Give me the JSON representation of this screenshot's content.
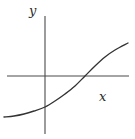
{
  "figure": {
    "title": "",
    "background_color": "#ffffff",
    "axis_color": "#4a4a4a",
    "curve_color": "#333333",
    "label_color": "#2a2a2a",
    "y_axis_label": "y",
    "x_axis_label": "x"
  },
  "chart_data": {
    "type": "line",
    "title": "",
    "xlabel": "x",
    "ylabel": "y",
    "grid": false,
    "legend": null,
    "axes": {
      "x_axis": {
        "label": "x",
        "pixel_y": 76,
        "pixel_x_start": 7,
        "pixel_x_end": 129,
        "ticks": [],
        "tick_labels": []
      },
      "y_axis": {
        "label": "y",
        "pixel_x": 45,
        "pixel_y_start": 16,
        "pixel_y_end": 134,
        "ticks": [],
        "tick_labels": []
      }
    },
    "annotations": [
      {
        "text": "y",
        "pixel_x": 33,
        "pixel_y": 11
      },
      {
        "text": "x",
        "pixel_x": 104,
        "pixel_y": 96
      }
    ],
    "series": [
      {
        "name": "curve",
        "description": "increasing exponential-like curve, asymptotic to a horizontal line on the left, crossing the x-axis right of the origin",
        "points_pixel": [
          [
            4,
            117
          ],
          [
            14,
            116
          ],
          [
            24,
            114
          ],
          [
            34,
            111
          ],
          [
            45,
            107
          ],
          [
            55,
            101
          ],
          [
            65,
            94
          ],
          [
            75,
            86
          ],
          [
            85,
            76
          ],
          [
            95,
            66
          ],
          [
            105,
            57
          ],
          [
            115,
            50
          ],
          [
            128,
            43
          ]
        ],
        "x_intercept_pixel": 85,
        "y_intercept_pixel": 107
      }
    ]
  }
}
